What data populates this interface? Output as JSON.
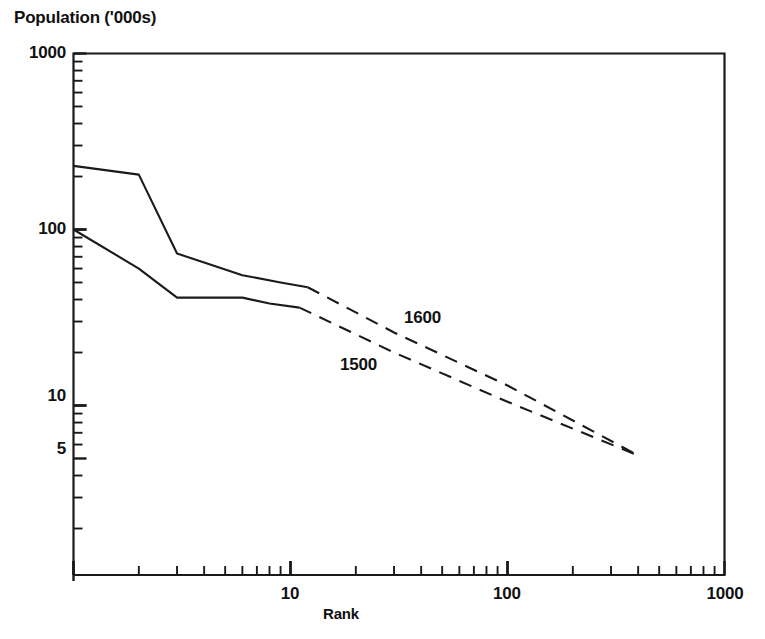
{
  "chart_data": {
    "type": "line",
    "title": "",
    "ylabel": "Population ('000s)",
    "xlabel": "Rank",
    "xscale": "log",
    "yscale": "log",
    "xlim": [
      1,
      1000
    ],
    "ylim": [
      3.2,
      1000
    ],
    "grid": false,
    "legend_position": "inline-annotation",
    "x_ticks": [
      {
        "value": 1,
        "label": ""
      },
      {
        "value": 10,
        "label": "10"
      },
      {
        "value": 100,
        "label": "100"
      },
      {
        "value": 1000,
        "label": "1000"
      }
    ],
    "y_ticks": [
      {
        "value": 1000,
        "label": "1000"
      },
      {
        "value": 100,
        "label": "100"
      },
      {
        "value": 10,
        "label": "10"
      },
      {
        "value": 5,
        "label": "5"
      }
    ],
    "series": [
      {
        "name": "1600",
        "annotation": "1600",
        "style": "solid-then-dashed",
        "solid_points": [
          {
            "rank": 1,
            "population": 230
          },
          {
            "rank": 2,
            "population": 205
          },
          {
            "rank": 3,
            "population": 73
          },
          {
            "rank": 4,
            "population": 65
          },
          {
            "rank": 6,
            "population": 55
          },
          {
            "rank": 9,
            "population": 50
          },
          {
            "rank": 12,
            "population": 47
          }
        ],
        "dashed_points": [
          {
            "rank": 12,
            "population": 47
          },
          {
            "rank": 30,
            "population": 26
          },
          {
            "rank": 100,
            "population": 13
          },
          {
            "rank": 400,
            "population": 5.2
          }
        ]
      },
      {
        "name": "1500",
        "annotation": "1500",
        "style": "solid-then-dashed",
        "solid_points": [
          {
            "rank": 1,
            "population": 100
          },
          {
            "rank": 2,
            "population": 60
          },
          {
            "rank": 3,
            "population": 41
          },
          {
            "rank": 4,
            "population": 41
          },
          {
            "rank": 6,
            "population": 41
          },
          {
            "rank": 8,
            "population": 38
          },
          {
            "rank": 11,
            "population": 36
          }
        ],
        "dashed_points": [
          {
            "rank": 11,
            "population": 36
          },
          {
            "rank": 30,
            "population": 20
          },
          {
            "rank": 100,
            "population": 10.5
          },
          {
            "rank": 400,
            "population": 5.2
          }
        ]
      }
    ]
  },
  "axes": {
    "y_title": "Population ('000s)",
    "x_title": "Rank",
    "y_tick_labels": [
      "1000",
      "100",
      "10",
      "5"
    ],
    "x_tick_labels": [
      "10",
      "100",
      "1000"
    ]
  },
  "annotations": {
    "upper_series": "1600",
    "lower_series": "1500"
  },
  "colors": {
    "line": "#1a1a1a",
    "axis": "#1a1a1a",
    "text": "#111111",
    "background": "#ffffff"
  }
}
